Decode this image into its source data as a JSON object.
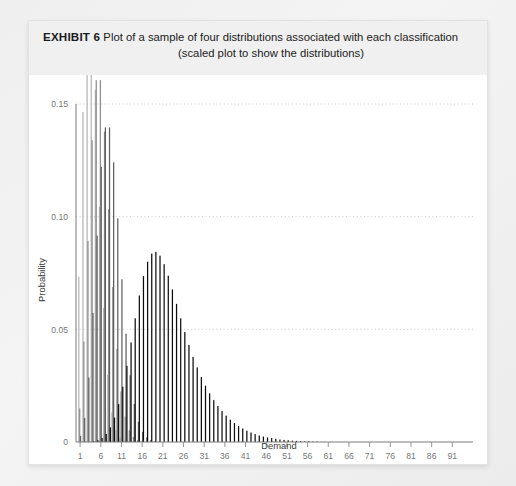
{
  "card": {
    "exhibit_label": "EXHIBIT 6",
    "title_line1": " Plot of a sample of four distributions associated with each classification",
    "title_line2": "(scaled plot to show the distributions)"
  },
  "chart_data": {
    "type": "bar",
    "title": "Plot of a sample of four distributions associated with each classification (scaled plot to show the distributions)",
    "xlabel": "Demand",
    "ylabel": "Probability",
    "xlim": [
      1,
      95
    ],
    "ylim": [
      0,
      0.15
    ],
    "grid": true,
    "grid_axis": "y",
    "legend_position": "none",
    "y_ticks": [
      0,
      0.05,
      0.1,
      0.15
    ],
    "y_tick_labels": [
      "0",
      "0.05",
      "0.10",
      "0.15"
    ],
    "x_ticks": [
      1,
      6,
      11,
      16,
      21,
      26,
      31,
      36,
      41,
      46,
      51,
      56,
      61,
      66,
      71,
      76,
      81,
      86,
      91
    ],
    "x_tick_labels": [
      "1",
      "6",
      "11",
      "16",
      "21",
      "26",
      "31",
      "36",
      "41",
      "46",
      "51",
      "56",
      "61",
      "66",
      "71",
      "76",
      "81",
      "86",
      "91"
    ],
    "x": [
      1,
      2,
      3,
      4,
      5,
      6,
      7,
      8,
      9,
      10,
      11,
      12,
      13,
      14,
      15,
      16,
      17,
      18,
      19,
      20,
      21,
      22,
      23,
      24,
      25,
      26,
      27,
      28,
      29,
      30,
      31,
      32,
      33,
      34,
      35,
      36,
      37,
      38,
      39,
      40,
      41,
      42,
      43,
      44,
      45,
      46,
      47,
      48,
      49,
      50,
      51,
      52,
      53,
      54,
      55,
      56,
      57,
      58,
      59,
      60,
      61,
      62,
      63,
      64,
      65,
      66,
      67,
      68,
      69,
      70,
      71,
      72,
      73,
      74,
      75,
      76,
      77,
      78,
      79,
      80,
      81,
      82,
      83,
      84,
      85,
      86,
      87,
      88,
      89,
      90,
      91,
      92,
      93,
      94,
      95
    ],
    "series": [
      {
        "name": "Distribution A",
        "color": "#b5b5b5",
        "mean": 4,
        "values": [
          0.0733,
          0.1465,
          0.1954,
          0.1954,
          0.1563,
          0.1042,
          0.0595,
          0.0298,
          0.0132,
          0.0053,
          0.0019,
          0.0006,
          0.0002,
          0.0001,
          0.0,
          0.0,
          0.0,
          0.0,
          0.0,
          0.0,
          0.0,
          0.0,
          0.0,
          0.0,
          0.0,
          0.0,
          0.0,
          0.0,
          0.0,
          0.0,
          0.0,
          0.0,
          0.0,
          0.0,
          0.0,
          0.0,
          0.0,
          0.0,
          0.0,
          0.0,
          0.0,
          0.0,
          0.0,
          0.0,
          0.0,
          0.0,
          0.0,
          0.0,
          0.0,
          0.0,
          0.0,
          0.0,
          0.0,
          0.0,
          0.0,
          0.0,
          0.0,
          0.0,
          0.0,
          0.0,
          0.0,
          0.0,
          0.0,
          0.0,
          0.0,
          0.0,
          0.0,
          0.0,
          0.0,
          0.0,
          0.0,
          0.0,
          0.0,
          0.0,
          0.0,
          0.0,
          0.0,
          0.0,
          0.0,
          0.0,
          0.0,
          0.0,
          0.0,
          0.0,
          0.0,
          0.0,
          0.0,
          0.0,
          0.0,
          0.0,
          0.0,
          0.0,
          0.0,
          0.0,
          0.0
        ]
      },
      {
        "name": "Distribution B",
        "color": "#8c8c8c",
        "mean": 6,
        "values": [
          0.0149,
          0.0446,
          0.0892,
          0.1339,
          0.1606,
          0.1606,
          0.1377,
          0.1033,
          0.0688,
          0.0413,
          0.0225,
          0.0113,
          0.0052,
          0.0022,
          0.0009,
          0.0003,
          0.0001,
          0.0,
          0.0,
          0.0,
          0.0,
          0.0,
          0.0,
          0.0,
          0.0,
          0.0,
          0.0,
          0.0,
          0.0,
          0.0,
          0.0,
          0.0,
          0.0,
          0.0,
          0.0,
          0.0,
          0.0,
          0.0,
          0.0,
          0.0,
          0.0,
          0.0,
          0.0,
          0.0,
          0.0,
          0.0,
          0.0,
          0.0,
          0.0,
          0.0,
          0.0,
          0.0,
          0.0,
          0.0,
          0.0,
          0.0,
          0.0,
          0.0,
          0.0,
          0.0,
          0.0,
          0.0,
          0.0,
          0.0,
          0.0,
          0.0,
          0.0,
          0.0,
          0.0,
          0.0,
          0.0,
          0.0,
          0.0,
          0.0,
          0.0,
          0.0,
          0.0,
          0.0,
          0.0,
          0.0,
          0.0,
          0.0,
          0.0,
          0.0,
          0.0,
          0.0,
          0.0,
          0.0,
          0.0,
          0.0,
          0.0,
          0.0,
          0.0,
          0.0,
          0.0
        ]
      },
      {
        "name": "Distribution C",
        "color": "#5e5e5e",
        "mean": 8,
        "values": [
          0.0027,
          0.0107,
          0.0286,
          0.0573,
          0.0916,
          0.1221,
          0.1396,
          0.1396,
          0.1241,
          0.0993,
          0.0722,
          0.0481,
          0.0296,
          0.0169,
          0.009,
          0.0045,
          0.0021,
          0.0009,
          0.0004,
          0.0002,
          0.0001,
          0.0,
          0.0,
          0.0,
          0.0,
          0.0,
          0.0,
          0.0,
          0.0,
          0.0,
          0.0,
          0.0,
          0.0,
          0.0,
          0.0,
          0.0,
          0.0,
          0.0,
          0.0,
          0.0,
          0.0,
          0.0,
          0.0,
          0.0,
          0.0,
          0.0,
          0.0,
          0.0,
          0.0,
          0.0,
          0.0,
          0.0,
          0.0,
          0.0,
          0.0,
          0.0,
          0.0,
          0.0,
          0.0,
          0.0,
          0.0,
          0.0,
          0.0,
          0.0,
          0.0,
          0.0,
          0.0,
          0.0,
          0.0,
          0.0,
          0.0,
          0.0,
          0.0,
          0.0,
          0.0,
          0.0,
          0.0,
          0.0,
          0.0,
          0.0,
          0.0,
          0.0,
          0.0,
          0.0,
          0.0,
          0.0,
          0.0,
          0.0,
          0.0,
          0.0,
          0.0,
          0.0,
          0.0,
          0.0,
          0.0
        ]
      },
      {
        "name": "Distribution D",
        "color": "#0d0d0d",
        "mean": 22,
        "values": [
          0.0,
          0.0,
          0.0001,
          0.0003,
          0.0008,
          0.0018,
          0.0036,
          0.0065,
          0.0108,
          0.0168,
          0.0245,
          0.0338,
          0.0442,
          0.0549,
          0.065,
          0.0736,
          0.08,
          0.0836,
          0.0844,
          0.0827,
          0.0789,
          0.0738,
          0.0677,
          0.0613,
          0.0549,
          0.0488,
          0.0431,
          0.0378,
          0.0331,
          0.0288,
          0.025,
          0.0216,
          0.0186,
          0.016,
          0.0137,
          0.0117,
          0.0099,
          0.0084,
          0.0071,
          0.006,
          0.005,
          0.0042,
          0.0035,
          0.0029,
          0.0024,
          0.002,
          0.0017,
          0.0014,
          0.0011,
          0.0009,
          0.0008,
          0.0006,
          0.0005,
          0.0004,
          0.0003,
          0.0003,
          0.0002,
          0.0002,
          0.0001,
          0.0001,
          0.0001,
          0.0001,
          0.0001,
          0.0,
          0.0,
          0.0,
          0.0,
          0.0,
          0.0,
          0.0,
          0.0,
          0.0,
          0.0,
          0.0,
          0.0,
          0.0,
          0.0,
          0.0,
          0.0,
          0.0,
          0.0,
          0.0,
          0.0,
          0.0,
          0.0,
          0.0,
          0.0,
          0.0,
          0.0,
          0.0,
          0.0,
          0.0,
          0.0,
          0.0,
          0.0
        ]
      }
    ],
    "scale_note": "Distribution D (black) is shown scaled down relative to the others so all four distributions are visible"
  }
}
